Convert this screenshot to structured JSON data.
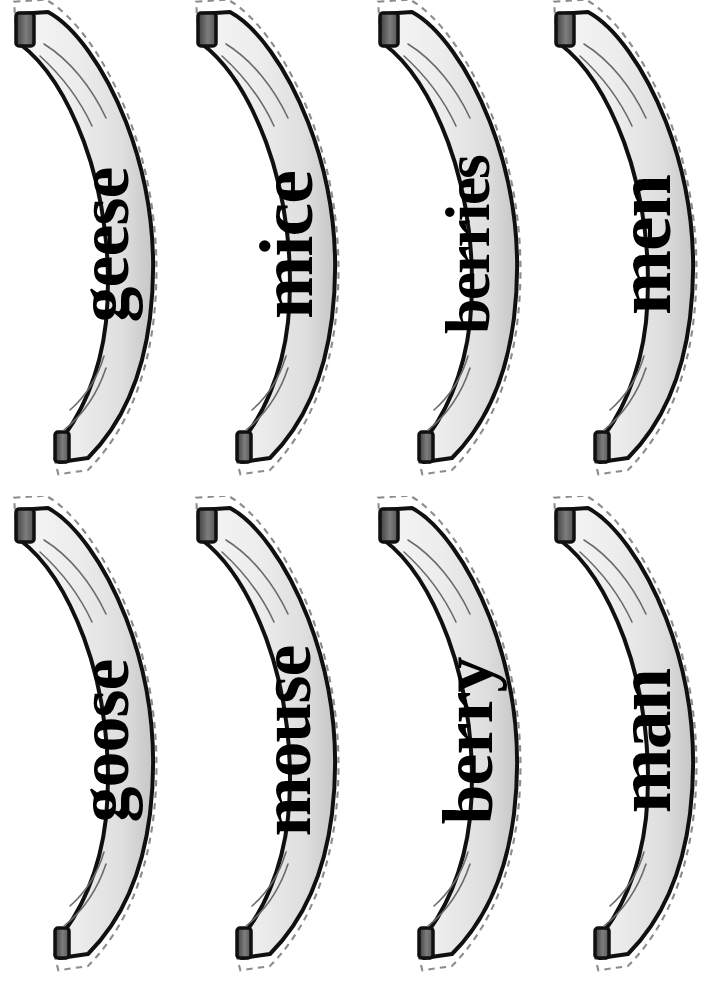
{
  "page": {
    "background_color": "#ffffff",
    "width": 725,
    "height": 987,
    "columns": 4,
    "rows": 2
  },
  "colors": {
    "banana_fill_light": "#f2f2f2",
    "banana_fill_mid": "#e3e3e3",
    "banana_fill_dark": "#c9c9c9",
    "outline": "#101010",
    "cut_line": "#8c8c8c",
    "stem": "#6e6e6e",
    "stem_dark": "#4a4a4a",
    "text": "#000000",
    "detail_line": "#6b6b6b"
  },
  "cards": [
    {
      "id": "card-geese",
      "word": "geese",
      "row": 0,
      "col": 0,
      "shape": "banana",
      "text_rotation": -90
    },
    {
      "id": "card-mice",
      "word": "mice",
      "row": 0,
      "col": 1,
      "shape": "banana",
      "text_rotation": -90
    },
    {
      "id": "card-berries",
      "word": "berries",
      "row": 0,
      "col": 2,
      "shape": "banana",
      "text_rotation": -90
    },
    {
      "id": "card-men",
      "word": "men",
      "row": 0,
      "col": 3,
      "shape": "banana",
      "text_rotation": -90
    },
    {
      "id": "card-goose",
      "word": "goose",
      "row": 1,
      "col": 0,
      "shape": "banana",
      "text_rotation": -90
    },
    {
      "id": "card-mouse",
      "word": "mouse",
      "row": 1,
      "col": 1,
      "shape": "banana",
      "text_rotation": -90
    },
    {
      "id": "card-berry",
      "word": "berry",
      "row": 1,
      "col": 2,
      "shape": "banana",
      "text_rotation": -90
    },
    {
      "id": "card-man",
      "word": "man",
      "row": 1,
      "col": 3,
      "shape": "banana",
      "text_rotation": -90
    }
  ],
  "icons": {
    "banana": "banana-icon",
    "stem": "banana-stem-icon",
    "tip": "banana-tip-icon",
    "cut_line": "scissors-cut-line-icon"
  }
}
